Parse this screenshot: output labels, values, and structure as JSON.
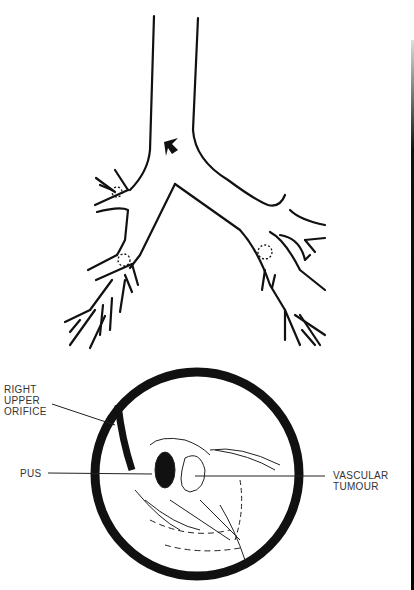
{
  "figure": {
    "top_panel": "bronchial-tree-diagram",
    "bottom_panel": "bronchoscopic-view"
  },
  "labels": {
    "right_upper_orifice": [
      "RIGHT",
      "UPPER",
      "ORIFICE"
    ],
    "pus": "PUS",
    "vascular_tumour": [
      "VASCULAR",
      "TUMOUR"
    ]
  },
  "colors": {
    "ink": "#111111",
    "label": "#333333",
    "background": "#ffffff"
  }
}
